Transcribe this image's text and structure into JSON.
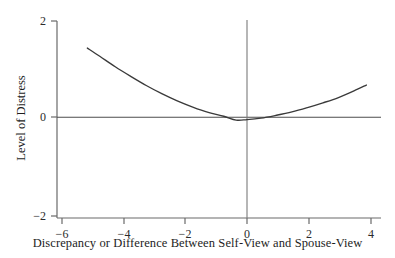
{
  "chart_data": {
    "type": "line",
    "title": "",
    "subtitle": "",
    "xlabel": "Discrepancy or Difference Between Self-View and Spouse-View",
    "ylabel": "Level of Distress",
    "xlim": [
      -6.8,
      4.6
    ],
    "ylim": [
      -2.25,
      2.25
    ],
    "xticks": [
      -6,
      -4,
      -2,
      0,
      2,
      4
    ],
    "xtick_labels": [
      "−6",
      "−4",
      "−2",
      "0",
      "2",
      "4"
    ],
    "yticks": [
      -2,
      0,
      2
    ],
    "ytick_labels": [
      "−2",
      "0",
      "2"
    ],
    "grid": false,
    "legend": false,
    "reference_lines": [
      {
        "name": "y-zero-line",
        "orientation": "horizontal",
        "value": 0
      },
      {
        "name": "x-zero-line",
        "orientation": "vertical",
        "value": 0
      }
    ],
    "series": [
      {
        "name": "quadratic-distress-curve",
        "color": "#3a3a3a",
        "x": [
          -5.15,
          -4.75,
          -4.25,
          -3.75,
          -3.25,
          -2.75,
          -2.25,
          -1.75,
          -1.25,
          -0.75,
          -0.35,
          0.0,
          0.45,
          0.95,
          1.45,
          1.95,
          2.45,
          2.95,
          3.45,
          3.85
        ],
        "y": [
          1.44,
          1.27,
          1.05,
          0.85,
          0.66,
          0.49,
          0.34,
          0.21,
          0.1,
          0.02,
          -0.06,
          -0.05,
          -0.02,
          0.04,
          0.11,
          0.2,
          0.3,
          0.41,
          0.55,
          0.67
        ]
      }
    ],
    "annotations": []
  },
  "figure": {
    "background_color": "#ffffff",
    "axis_color": "#555555",
    "curve_color": "#3a3a3a"
  }
}
